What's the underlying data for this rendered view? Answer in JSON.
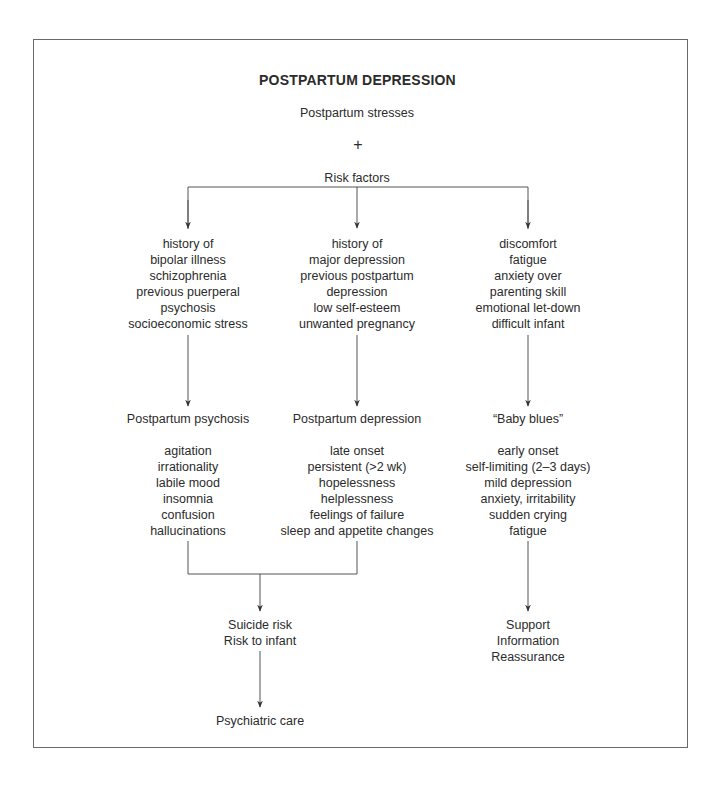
{
  "title": "POSTPARTUM DEPRESSION",
  "top": {
    "stresses": "Postpartum stresses",
    "plus": "+",
    "risk_factors": "Risk factors"
  },
  "columns": [
    {
      "risk_items": [
        "history of",
        "bipolar illness",
        "schizophrenia",
        "previous puerperal",
        "psychosis",
        "socioeconomic stress"
      ],
      "heading": "Postpartum psychosis",
      "symptoms": [
        "agitation",
        "irrationality",
        "labile mood",
        "insomnia",
        "confusion",
        "hallucinations"
      ]
    },
    {
      "risk_items": [
        "history of",
        "major depression",
        "previous postpartum",
        "depression",
        "low self-esteem",
        "unwanted pregnancy"
      ],
      "heading": "Postpartum depression",
      "symptoms": [
        "late onset",
        "persistent (>2 wk)",
        "hopelessness",
        "helplessness",
        "feelings of failure",
        "sleep and appetite changes"
      ]
    },
    {
      "risk_items": [
        "discomfort",
        "fatigue",
        "anxiety over",
        "parenting skill",
        "emotional let-down",
        "difficult infant"
      ],
      "heading": "“Baby blues”",
      "symptoms": [
        "early onset",
        "self-limiting (2–3 days)",
        "mild depression",
        "anxiety, irritability",
        "sudden crying",
        "fatigue"
      ]
    }
  ],
  "outcomes": {
    "severe": [
      "Suicide risk",
      "Risk to infant"
    ],
    "severe_action": "Psychiatric care",
    "mild": [
      "Support",
      "Information",
      "Reassurance"
    ]
  },
  "colors": {
    "line": "#555555",
    "text": "#2b2b2b",
    "border": "#6a6a6a"
  }
}
